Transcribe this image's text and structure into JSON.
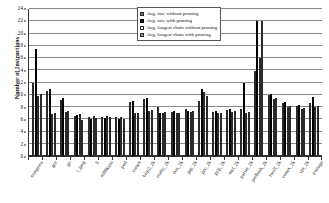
{
  "chart_data": {
    "type": "bar",
    "title": "",
    "xlabel": "",
    "ylabel": "Number of Instructions",
    "ylim": [
      0,
      24
    ],
    "ytick_step": 2,
    "yticks": [
      0,
      2,
      4,
      6,
      8,
      10,
      12,
      14,
      16,
      18,
      20,
      22,
      24
    ],
    "grid": true,
    "legend_position": "top-right",
    "categories": [
      "compress",
      "gcc",
      "go",
      "i_jpeg",
      "li",
      "m88ksim",
      "perl",
      "vortex",
      "bzip2_2k",
      "crafty_2k",
      "eon_2k",
      "gap_2k",
      "gcc_2k",
      "gzip_2k",
      "mcf_2k",
      "parser_2k",
      "perlbmk_2k",
      "twolf_2k",
      "vortex_2k",
      "vpr_2k",
      "average"
    ],
    "series": [
      {
        "name": "Avg. size without pruning",
        "color": "#6e6e6e",
        "values": [
          12.0,
          10.6,
          9.2,
          6.6,
          6.4,
          6.4,
          6.3,
          8.9,
          9.3,
          8.0,
          7.2,
          7.6,
          9.0,
          7.2,
          7.5,
          7.6,
          13.9,
          9.9,
          8.7,
          8.2,
          8.6
        ]
      },
      {
        "name": "Avg. size with pruning",
        "color": "#111111",
        "values": [
          17.4,
          11.0,
          9.4,
          6.7,
          6.1,
          6.2,
          6.1,
          9.0,
          9.4,
          7.0,
          7.3,
          7.4,
          11.0,
          7.3,
          7.6,
          12.0,
          22.0,
          10.1,
          8.9,
          8.4,
          9.6
        ]
      },
      {
        "name": "Avg. longest chain without pruning",
        "color": "#ffffff",
        "values": [
          9.8,
          6.9,
          7.2,
          6.8,
          6.5,
          6.6,
          6.3,
          7.0,
          7.3,
          7.1,
          7.0,
          7.2,
          10.5,
          7.0,
          7.2,
          7.0,
          16.0,
          9.3,
          8.0,
          7.7,
          8.0
        ]
      },
      {
        "name": "Avg. longest chain with pruning",
        "color": "#9a9a9a",
        "values": [
          10.2,
          7.1,
          7.4,
          5.9,
          6.2,
          6.3,
          6.0,
          7.1,
          7.5,
          7.2,
          7.1,
          7.3,
          9.8,
          7.1,
          7.3,
          7.2,
          22.0,
          9.5,
          8.1,
          7.9,
          8.2
        ]
      }
    ]
  }
}
